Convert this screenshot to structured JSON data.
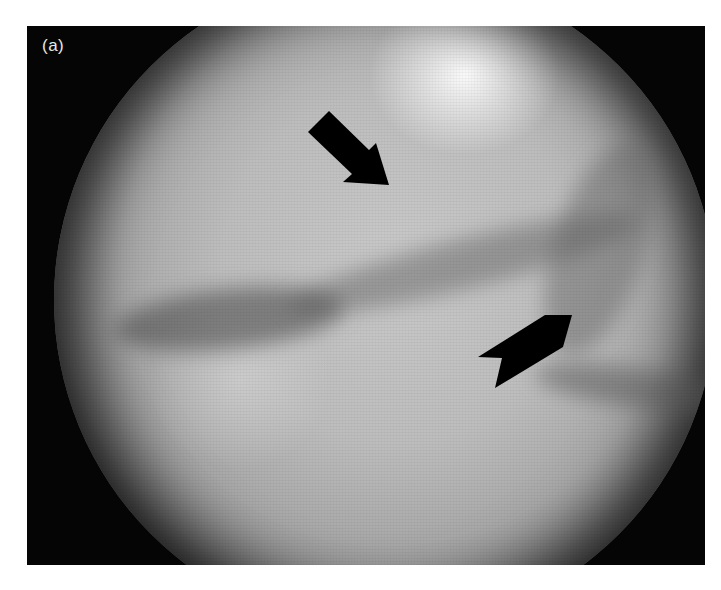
{
  "figure": {
    "panel_label": "(a)",
    "image_type": "grayscale circular endoscopic/fluoroscopic view",
    "annotations": [
      {
        "type": "arrow",
        "name": "upper-arrow",
        "direction": "pointing down-right",
        "color": "#000000"
      },
      {
        "type": "arrow",
        "name": "lower-arrow",
        "direction": "pointing up-right",
        "color": "#000000"
      }
    ],
    "colors": {
      "background": "#ffffff",
      "frame": "#050505",
      "field_mid": "#bdbdbd",
      "highlight": "#ffffff",
      "label": "#e8e8e8"
    }
  }
}
